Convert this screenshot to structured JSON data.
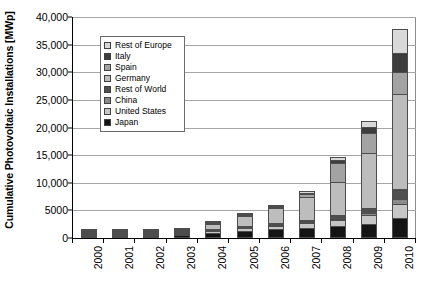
{
  "chart_data": {
    "type": "bar",
    "stacked": true,
    "title": "",
    "xlabel": "",
    "ylabel": "Cumulative Photovoltaic Installations [MWp]",
    "ylim": [
      0,
      40000
    ],
    "ytick_labels": [
      "0",
      "5000",
      "10,000",
      "15,000",
      "20,000",
      "25,000",
      "30,000",
      "35,000",
      "40,000"
    ],
    "ytick_values": [
      0,
      5000,
      10000,
      15000,
      20000,
      25000,
      30000,
      35000,
      40000
    ],
    "grid": true,
    "grid_axis": "y",
    "legend_position": "upper left inside",
    "categories": [
      "2000",
      "2001",
      "2002",
      "2003",
      "2004",
      "2005",
      "2006",
      "2007",
      "2008",
      "2009",
      "2010"
    ],
    "series": [
      {
        "name": "Japan",
        "color": "#141414",
        "values": [
          330,
          453,
          637,
          860,
          1132,
          1422,
          1709,
          1919,
          2144,
          2627,
          3617
        ]
      },
      {
        "name": "United States",
        "color": "#c6c6c6",
        "values": [
          139,
          168,
          212,
          275,
          376,
          479,
          624,
          831,
          1169,
          1616,
          2528
        ]
      },
      {
        "name": "China",
        "color": "#8a8a8a",
        "values": [
          19,
          24,
          42,
          52,
          62,
          70,
          80,
          100,
          140,
          305,
          893
        ]
      },
      {
        "name": "Rest of World",
        "color": "#4f4f4f",
        "values": [
          60,
          78,
          100,
          125,
          160,
          210,
          280,
          390,
          600,
          950,
          1800
        ]
      },
      {
        "name": "Germany",
        "color": "#bdbdbd",
        "values": [
          114,
          195,
          296,
          435,
          1105,
          2056,
          2899,
          4170,
          6120,
          9959,
          17320
        ]
      },
      {
        "name": "Spain",
        "color": "#a3a3a3",
        "values": [
          2,
          5,
          9,
          16,
          37,
          60,
          145,
          693,
          3463,
          3523,
          3892
        ]
      },
      {
        "name": "Italy",
        "color": "#3d3d3d",
        "values": [
          19,
          22,
          22,
          26,
          31,
          38,
          50,
          120,
          458,
          1181,
          3502
        ]
      },
      {
        "name": "Rest of Europe",
        "color": "#d9d9d9",
        "values": [
          40,
          55,
          70,
          90,
          120,
          165,
          230,
          330,
          500,
          1100,
          4330
        ]
      }
    ],
    "legend_entries": [
      {
        "label": "Rest of Europe",
        "color": "#d9d9d9"
      },
      {
        "label": "Italy",
        "color": "#3d3d3d"
      },
      {
        "label": "Spain",
        "color": "#a3a3a3"
      },
      {
        "label": "Germany",
        "color": "#bdbdbd"
      },
      {
        "label": "Rest of World",
        "color": "#4f4f4f"
      },
      {
        "label": "China",
        "color": "#8a8a8a"
      },
      {
        "label": "United States",
        "color": "#c6c6c6"
      },
      {
        "label": "Japan",
        "color": "#141414"
      }
    ]
  }
}
